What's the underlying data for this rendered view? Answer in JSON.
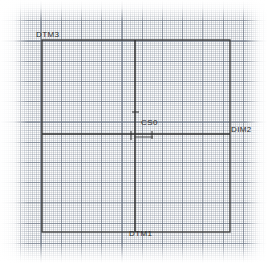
{
  "drawing": {
    "title": "Datum reference frame drawing",
    "medium": "graph-paper-scan",
    "background_color": "#fdfdfd",
    "ink_color": "#2b2b2b",
    "grid_color": "#6e7a8a",
    "canvas": {
      "width": 267,
      "height": 263
    },
    "grid": {
      "fine_spacing_px": 4,
      "major_spacing_px": 20,
      "style": "dotted"
    },
    "labels": [
      {
        "id": "dtm3",
        "text": "DTM3",
        "x": 36,
        "y": 31,
        "anchor": "top-left-corner"
      },
      {
        "id": "cs0",
        "text": "CS0",
        "x": 141,
        "y": 119,
        "anchor": "origin"
      },
      {
        "id": "dim2",
        "text": "DIM2",
        "x": 231,
        "y": 126,
        "anchor": "right-axis-end"
      },
      {
        "id": "dtm1",
        "text": "DTM1",
        "x": 129,
        "y": 230,
        "anchor": "bottom-axis-end"
      }
    ],
    "geometry": {
      "rectangle": {
        "left": 42,
        "top": 40,
        "right": 230,
        "bottom": 232
      },
      "horizontal_axis": {
        "y": 134,
        "x_start": 42,
        "x_end": 230
      },
      "vertical_axis": {
        "x": 135,
        "y_start": 40,
        "y_end": 232
      },
      "origin": {
        "x": 135,
        "y": 134
      }
    }
  }
}
